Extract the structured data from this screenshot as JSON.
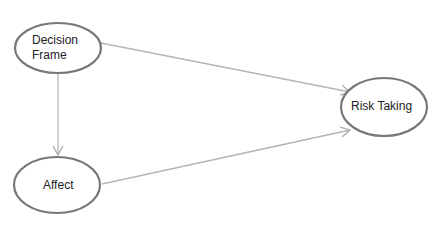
{
  "diagram": {
    "type": "path-model",
    "nodes": [
      {
        "id": "decision_frame",
        "label_line1": "Decision",
        "label_line2": "Frame"
      },
      {
        "id": "affect",
        "label": "Affect"
      },
      {
        "id": "risk_taking",
        "label": "Risk Taking"
      }
    ],
    "edges": [
      {
        "from": "decision_frame",
        "to": "risk_taking"
      },
      {
        "from": "decision_frame",
        "to": "affect"
      },
      {
        "from": "affect",
        "to": "risk_taking"
      }
    ],
    "colors": {
      "node_stroke": "#777777",
      "edge": "#b5b5b5",
      "text": "#222222"
    }
  }
}
